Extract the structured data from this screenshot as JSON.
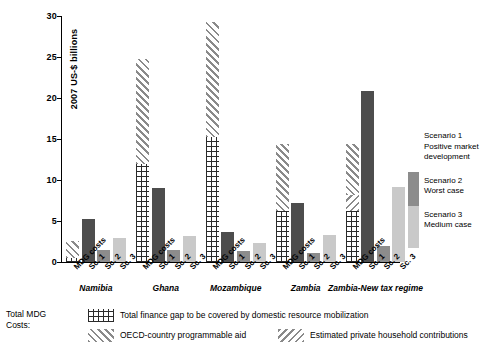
{
  "chart_data": {
    "type": "bar",
    "title": "",
    "xlabel": "",
    "ylabel": "2007 US-$ billions",
    "ylim": [
      0,
      30
    ],
    "yticks": [
      0,
      5,
      10,
      15,
      20,
      25,
      30
    ],
    "grid": false,
    "legend_position": "right",
    "categories": [
      "MDG costs",
      "Sc. 1",
      "Sc. 2",
      "Sc. 3"
    ],
    "groups": [
      {
        "name": "Namibia",
        "bars": [
          {
            "label": "MDG costs",
            "total": 2.6,
            "stack": [
              {
                "component": "Total finance gap to be covered by domestic resource mobilization",
                "pattern": "grid",
                "value": 0.55
              },
              {
                "component": "OECD-country programmable aid",
                "pattern": "forward-diagonal",
                "value": 2.05
              }
            ]
          },
          {
            "label": "Sc. 1",
            "value": 5.2,
            "fill": "sc1"
          },
          {
            "label": "Sc. 2",
            "value": 1.5,
            "fill": "sc2"
          },
          {
            "label": "Sc. 3",
            "value": 2.9,
            "fill": "sc3"
          }
        ]
      },
      {
        "name": "Ghana",
        "bars": [
          {
            "label": "MDG costs",
            "total": 24.7,
            "stack": [
              {
                "component": "Total finance gap to be covered by domestic resource mobilization",
                "pattern": "grid",
                "value": 11.9
              },
              {
                "component": "OECD-country programmable aid",
                "pattern": "forward-diagonal",
                "value": 12.8
              }
            ]
          },
          {
            "label": "Sc. 1",
            "value": 9.0,
            "fill": "sc1"
          },
          {
            "label": "Sc. 2",
            "value": 1.5,
            "fill": "sc2"
          },
          {
            "label": "Sc. 3",
            "value": 3.2,
            "fill": "sc3"
          }
        ]
      },
      {
        "name": "Mozambique",
        "bars": [
          {
            "label": "MDG costs",
            "total": 29.3,
            "stack": [
              {
                "component": "Total finance gap to be covered by domestic resource mobilization",
                "pattern": "grid",
                "value": 15.2
              },
              {
                "component": "OECD-country programmable aid",
                "pattern": "forward-diagonal",
                "value": 14.1
              }
            ]
          },
          {
            "label": "Sc. 1",
            "value": 3.7,
            "fill": "sc1"
          },
          {
            "label": "Sc. 2",
            "value": 1.4,
            "fill": "sc2"
          },
          {
            "label": "Sc. 3",
            "value": 2.3,
            "fill": "sc3"
          }
        ]
      },
      {
        "name": "Zambia",
        "bars": [
          {
            "label": "MDG costs",
            "total": 14.4,
            "stack": [
              {
                "component": "Total finance gap to be covered by domestic resource mobilization",
                "pattern": "grid",
                "value": 6.2
              },
              {
                "component": "OECD-country programmable aid",
                "pattern": "forward-diagonal",
                "value": 8.2
              }
            ]
          },
          {
            "label": "Sc. 1",
            "value": 7.2,
            "fill": "sc1"
          },
          {
            "label": "Sc. 2",
            "value": 1.1,
            "fill": "sc2"
          },
          {
            "label": "Sc. 3",
            "value": 3.3,
            "fill": "sc3"
          }
        ]
      },
      {
        "name": "Zambia-New tax regime",
        "bars": [
          {
            "label": "MDG costs",
            "total": 14.4,
            "stack": [
              {
                "component": "Total finance gap to be covered by domestic resource mobilization",
                "pattern": "grid",
                "value": 6.2
              },
              {
                "component": "Estimated private household contributions",
                "pattern": "backward-diagonal",
                "value": 2.0
              },
              {
                "component": "OECD-country programmable aid",
                "pattern": "forward-diagonal",
                "value": 6.2
              }
            ]
          },
          {
            "label": "Sc. 1",
            "value": 20.8,
            "fill": "sc1"
          },
          {
            "label": "Sc. 2",
            "value": 2.0,
            "fill": "sc2"
          },
          {
            "label": "Sc. 3",
            "value": 9.2,
            "fill": "sc3"
          }
        ]
      }
    ],
    "scenario_legend": [
      {
        "title": "Scenario 1",
        "desc": "Positive market development",
        "fill": "sc1"
      },
      {
        "title": "Scenario 2",
        "desc": "Worst case",
        "fill": "sc2"
      },
      {
        "title": "Scenario 3",
        "desc": "Medium case",
        "fill": "sc3"
      }
    ],
    "pattern_legend": {
      "title_line1": "Total MDG",
      "title_line2": "Costs:",
      "entries": [
        {
          "pattern": "grid",
          "label": "Total finance gap to be covered by domestic resource mobilization"
        },
        {
          "pattern": "forward-diagonal",
          "label": "OECD-country programmable aid"
        },
        {
          "pattern": "backward-diagonal",
          "label": "Estimated private household contributions"
        }
      ]
    }
  }
}
